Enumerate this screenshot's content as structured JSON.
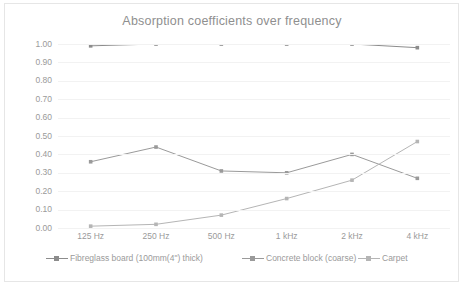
{
  "chart_data": {
    "type": "line",
    "title": "Absorption coefficients over frequency",
    "xlabel": "",
    "ylabel": "",
    "categories": [
      "125 Hz",
      "250 Hz",
      "500 Hz",
      "1 kHz",
      "2 kHz",
      "4 kHz"
    ],
    "ylim": [
      0.0,
      1.0
    ],
    "yticks": [
      "0.00",
      "0.10",
      "0.20",
      "0.30",
      "0.40",
      "0.50",
      "0.60",
      "0.70",
      "0.80",
      "0.90",
      "1.00"
    ],
    "ytick_values": [
      0.0,
      0.1,
      0.2,
      0.3,
      0.4,
      0.5,
      0.6,
      0.7,
      0.8,
      0.9,
      1.0
    ],
    "grid": true,
    "legend_position": "bottom",
    "series": [
      {
        "name": "Fibreglass board (100mm(4\") thick)",
        "values": [
          0.99,
          1.0,
          1.0,
          1.0,
          1.0,
          0.98
        ],
        "color": "#8c8c8c"
      },
      {
        "name": "Concrete block (coarse)",
        "values": [
          0.36,
          0.44,
          0.31,
          0.3,
          0.4,
          0.27
        ],
        "color": "#9a9a9a"
      },
      {
        "name": "Carpet",
        "values": [
          0.01,
          0.02,
          0.07,
          0.16,
          0.26,
          0.47
        ],
        "color": "#b5b5b5"
      }
    ]
  },
  "colors": {
    "background": "#ffffff",
    "title": "#8f8f8f",
    "tick_label": "#9a9a9a",
    "gridline": "#f2f2f2",
    "frame_border": "#e6e6e6"
  }
}
